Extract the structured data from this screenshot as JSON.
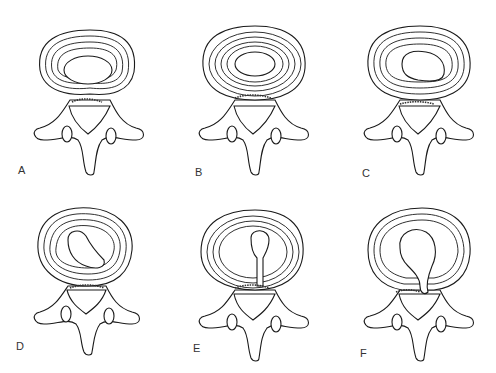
{
  "figure": {
    "type": "medical-illustration",
    "line_color": "#1a1a1a",
    "background": "#ffffff",
    "panels": [
      {
        "id": "A",
        "label": "A",
        "state": "normal nucleus, intact concentric annulus rings"
      },
      {
        "id": "B",
        "label": "B",
        "state": "nucleus centered, concentric rings, posterior annulus slightly disrupted"
      },
      {
        "id": "C",
        "label": "C",
        "state": "nucleus displaced posteriorly toward right"
      },
      {
        "id": "D",
        "label": "D",
        "state": "nucleus extending into posterior annulus fissure"
      },
      {
        "id": "E",
        "label": "E",
        "state": "radial fissure with nucleus tracking to posterior rim"
      },
      {
        "id": "F",
        "label": "F",
        "state": "nucleus extruded through posterior annulus"
      }
    ]
  }
}
